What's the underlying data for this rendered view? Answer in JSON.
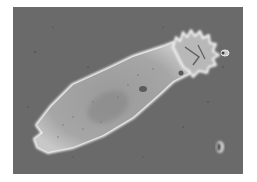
{
  "image": {
    "subject": "rotifer",
    "description": "Phase-contrast micrograph of a bdelloid rotifer with extended ciliated corona",
    "colors": {
      "background": "#ffffff",
      "field": "#6a6a6a",
      "body": "#a8a8a8",
      "halo": "#f2f2f2",
      "detail": "#5a5a5a"
    }
  }
}
